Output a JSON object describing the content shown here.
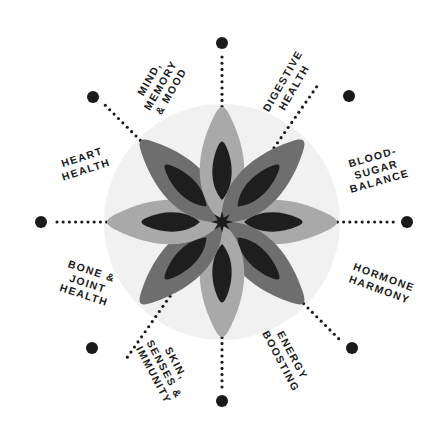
{
  "diagram": {
    "center": {
      "x": 222,
      "y": 222
    },
    "disc": {
      "radius": 118,
      "color": "#f1f1f1"
    },
    "colors": {
      "background": "#ffffff",
      "disc": "#f1f1f1",
      "petal_dark": "#6e6e6e",
      "petal_light": "#a9a9a9",
      "petal_inner": "#1e1e1e",
      "center_star": "#1a1a1a",
      "dot": "#1a1a1a",
      "label_text": "#1a1a1a"
    },
    "flower": {
      "petal_count": 8,
      "petals": [
        {
          "index": 0,
          "angle_deg": 0,
          "shade": "light"
        },
        {
          "index": 1,
          "angle_deg": 45,
          "shade": "dark"
        },
        {
          "index": 2,
          "angle_deg": 90,
          "shade": "light"
        },
        {
          "index": 3,
          "angle_deg": 135,
          "shade": "dark"
        },
        {
          "index": 4,
          "angle_deg": 180,
          "shade": "light"
        },
        {
          "index": 5,
          "angle_deg": 225,
          "shade": "dark"
        },
        {
          "index": 6,
          "angle_deg": 270,
          "shade": "light"
        },
        {
          "index": 7,
          "angle_deg": 315,
          "shade": "dark"
        }
      ]
    },
    "spokes": [
      {
        "id": "digestive-health",
        "angle_deg": -55,
        "dot": {
          "x": 349,
          "y": 96
        },
        "dot_radius": 6
      },
      {
        "id": "blood-sugar-balance",
        "angle_deg": 0,
        "dot": {
          "x": 407,
          "y": 222
        },
        "dot_radius": 6
      },
      {
        "id": "hormone-harmony",
        "angle_deg": 45,
        "dot": {
          "x": 352,
          "y": 348
        },
        "dot_radius": 6
      },
      {
        "id": "energy-boosting",
        "angle_deg": 90,
        "dot": {
          "x": 222,
          "y": 401
        },
        "dot_radius": 6
      },
      {
        "id": "skin-senses-immunity",
        "angle_deg": 125,
        "dot": {
          "x": 92,
          "y": 348
        },
        "dot_radius": 6
      },
      {
        "id": "bone-joint-health",
        "angle_deg": 180,
        "dot": {
          "x": 41,
          "y": 222
        },
        "dot_radius": 6
      },
      {
        "id": "heart-health",
        "angle_deg": 225,
        "dot": {
          "x": 93,
          "y": 97
        },
        "dot_radius": 6
      },
      {
        "id": "mind-memory-mood",
        "angle_deg": 270,
        "dot": {
          "x": 222,
          "y": 43
        },
        "dot_radius": 6
      }
    ],
    "labels": [
      {
        "id": "mind-memory-mood",
        "lines": [
          "MIND,",
          "MEMORY",
          "& MOOD"
        ],
        "rotation_deg": -60,
        "x": 160,
        "y": 85
      },
      {
        "id": "digestive-health",
        "lines": [
          "DIGESTIVE",
          "HEALTH"
        ],
        "rotation_deg": -60,
        "x": 288,
        "y": 84
      },
      {
        "id": "blood-sugar-balance",
        "lines": [
          "BLOOD-",
          "SUGAR",
          "BALANCE"
        ],
        "rotation_deg": -16,
        "x": 376,
        "y": 169
      },
      {
        "id": "hormone-harmony",
        "lines": [
          "HORMONE",
          "HARMONY"
        ],
        "rotation_deg": 20,
        "x": 382,
        "y": 283
      },
      {
        "id": "energy-boosting",
        "lines": [
          "ENERGY",
          "BOOSTING"
        ],
        "rotation_deg": 62,
        "x": 287,
        "y": 358
      },
      {
        "id": "skin-senses-immunity",
        "lines": [
          "SKIN,",
          "SENSES &",
          "IMMUNITY"
        ],
        "rotation_deg": 62,
        "x": 165,
        "y": 369
      },
      {
        "id": "bone-joint-health",
        "lines": [
          "BONE &",
          "JOINT",
          "HEALTH"
        ],
        "rotation_deg": 18,
        "x": 88,
        "y": 283
      },
      {
        "id": "heart-health",
        "lines": [
          "HEART",
          "HEALTH"
        ],
        "rotation_deg": -18,
        "x": 84,
        "y": 163
      }
    ]
  }
}
